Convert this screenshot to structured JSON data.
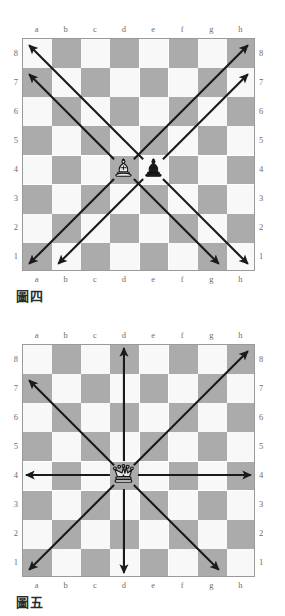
{
  "colors": {
    "light_square": "#f8f8f8",
    "dark_square": "#ababab",
    "border": "#9a9a9a",
    "arrow": "#1a1a1a",
    "label": "#6d6d6d",
    "caption": "#2b2b2b",
    "page_background": "#ffffff"
  },
  "board_labels": {
    "files": [
      "a",
      "b",
      "c",
      "d",
      "e",
      "f",
      "g",
      "h"
    ],
    "ranks": [
      "8",
      "7",
      "6",
      "5",
      "4",
      "3",
      "2",
      "1"
    ]
  },
  "figures": [
    {
      "caption": "圖四",
      "subject": "bishop-movement",
      "pieces": [
        {
          "type": "bishop",
          "color": "white",
          "square": "d4",
          "file": 3,
          "rank": 4
        },
        {
          "type": "bishop",
          "color": "black",
          "square": "e4",
          "file": 4,
          "rank": 4
        }
      ],
      "arrows": [
        {
          "from": "d4",
          "to": "a7",
          "direction": "up-left",
          "piece": "white-bishop"
        },
        {
          "from": "d4",
          "to": "a1",
          "direction": "down-left",
          "piece": "white-bishop"
        },
        {
          "from": "d4",
          "to": "h8",
          "direction": "up-right",
          "piece": "white-bishop"
        },
        {
          "from": "d4",
          "to": "g1",
          "direction": "down-right",
          "piece": "white-bishop"
        },
        {
          "from": "e4",
          "to": "a8",
          "direction": "up-left",
          "piece": "black-bishop"
        },
        {
          "from": "e4",
          "to": "b1",
          "direction": "down-left",
          "piece": "black-bishop"
        },
        {
          "from": "e4",
          "to": "h7",
          "direction": "up-right",
          "piece": "black-bishop"
        },
        {
          "from": "e4",
          "to": "h1",
          "direction": "down-right",
          "piece": "black-bishop"
        }
      ]
    },
    {
      "caption": "圖五",
      "subject": "queen-movement",
      "pieces": [
        {
          "type": "queen",
          "color": "white",
          "square": "d4",
          "file": 3,
          "rank": 4
        }
      ],
      "arrows": [
        {
          "from": "d4",
          "to": "d8",
          "direction": "up",
          "piece": "white-queen"
        },
        {
          "from": "d4",
          "to": "d1",
          "direction": "down",
          "piece": "white-queen"
        },
        {
          "from": "d4",
          "to": "a4",
          "direction": "left",
          "piece": "white-queen"
        },
        {
          "from": "d4",
          "to": "h4",
          "direction": "right",
          "piece": "white-queen"
        },
        {
          "from": "d4",
          "to": "a7",
          "direction": "up-left",
          "piece": "white-queen"
        },
        {
          "from": "d4",
          "to": "h8",
          "direction": "up-right",
          "piece": "white-queen"
        },
        {
          "from": "d4",
          "to": "a1",
          "direction": "down-left",
          "piece": "white-queen"
        },
        {
          "from": "d4",
          "to": "g1",
          "direction": "down-right",
          "piece": "white-queen"
        }
      ]
    }
  ]
}
